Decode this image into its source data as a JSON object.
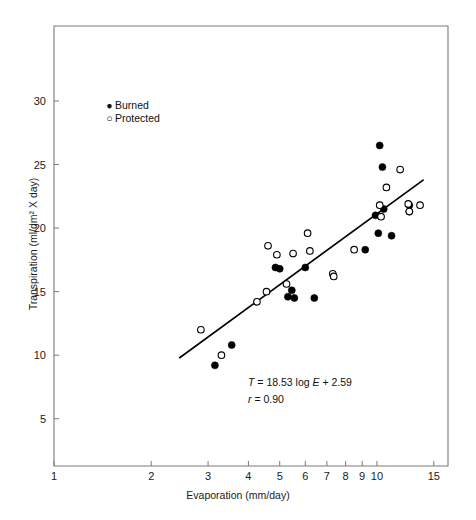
{
  "figure": {
    "background": "#ffffff",
    "frame_color": "#7a7a7a",
    "ink_color": "#000000"
  },
  "legend": {
    "burned": {
      "marker": "filled-circle",
      "glyph": "●",
      "label": "Burned"
    },
    "protected": {
      "marker": "open-circle",
      "glyph": "○",
      "label": "Protected"
    }
  },
  "annotations": {
    "equation": {
      "lhs": "T",
      "eq": " = 18.53 log ",
      "var": "E",
      "rhs": " + 2.59"
    },
    "correlation": {
      "lhs": "r",
      "rhs": " = 0.90"
    }
  },
  "chart_data": {
    "type": "scatter",
    "title": "",
    "xlabel": "Evaporation (mm/day)",
    "ylabel": "Transpiration (ml/dm² X day)",
    "xscale": "log",
    "yscale": "linear",
    "xlim": [
      1,
      16.6
    ],
    "ylim": [
      1.28,
      35.9
    ],
    "grid": false,
    "legend_position": "upper-left-inside",
    "xticks": [
      1,
      2,
      3,
      4,
      5,
      6,
      7,
      8,
      9,
      10,
      15
    ],
    "xtick_labels": [
      "1",
      "2",
      "3",
      "4",
      "5",
      "6",
      "7",
      "8",
      "9",
      "10",
      "15"
    ],
    "yticks": [
      5,
      10,
      15,
      20,
      25,
      30
    ],
    "ytick_labels": [
      "5",
      "10",
      "15",
      "20",
      "25",
      "30"
    ],
    "fit_line": {
      "label": "T = 18.53 log E + 2.59",
      "slope": 18.53,
      "intercept": 2.59,
      "r": 0.9,
      "x_start": 2.45,
      "x_end": 13.9
    },
    "series": [
      {
        "name": "Burned",
        "marker": "filled-circle",
        "color": "#000000",
        "points": [
          [
            3.15,
            9.2
          ],
          [
            3.55,
            10.8
          ],
          [
            4.85,
            16.9
          ],
          [
            5.0,
            16.8
          ],
          [
            5.3,
            14.6
          ],
          [
            5.45,
            15.1
          ],
          [
            5.55,
            14.5
          ],
          [
            6.0,
            16.9
          ],
          [
            6.4,
            14.5
          ],
          [
            9.2,
            18.3
          ],
          [
            9.9,
            21.0
          ],
          [
            10.1,
            19.6
          ],
          [
            10.2,
            26.5
          ],
          [
            10.4,
            24.8
          ],
          [
            10.5,
            21.5
          ],
          [
            11.1,
            19.4
          ],
          [
            12.6,
            21.8
          ],
          [
            12.6,
            21.3
          ]
        ]
      },
      {
        "name": "Protected",
        "marker": "open-circle",
        "color": "#000000",
        "points": [
          [
            2.85,
            12.0
          ],
          [
            3.3,
            10.0
          ],
          [
            4.25,
            14.2
          ],
          [
            4.55,
            15.0
          ],
          [
            4.6,
            18.6
          ],
          [
            4.9,
            17.9
          ],
          [
            5.25,
            15.6
          ],
          [
            5.5,
            18.0
          ],
          [
            6.1,
            19.6
          ],
          [
            6.2,
            18.2
          ],
          [
            7.3,
            16.4
          ],
          [
            7.35,
            16.2
          ],
          [
            8.5,
            18.3
          ],
          [
            10.2,
            21.8
          ],
          [
            10.3,
            20.9
          ],
          [
            10.7,
            23.2
          ],
          [
            11.8,
            24.6
          ],
          [
            12.5,
            21.9
          ],
          [
            12.6,
            21.3
          ],
          [
            13.6,
            21.8
          ]
        ]
      }
    ]
  }
}
